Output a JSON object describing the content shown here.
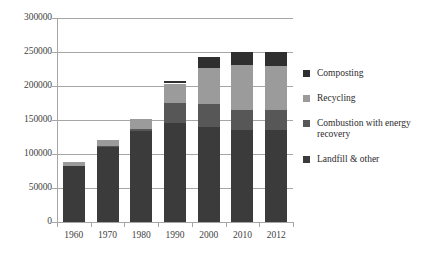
{
  "chart_data": {
    "type": "bar",
    "stacked": true,
    "title": "",
    "xlabel": "",
    "ylabel": "",
    "categories": [
      "1960",
      "1970",
      "1980",
      "1990",
      "2000",
      "2010",
      "2012"
    ],
    "ylim": [
      0,
      300000
    ],
    "ytick_labels": [
      "0",
      "50000",
      "100000",
      "150000",
      "200000",
      "250000",
      "300000"
    ],
    "ytick_values": [
      0,
      50000,
      100000,
      150000,
      200000,
      250000,
      300000
    ],
    "grid": true,
    "legend_position": "right",
    "series": [
      {
        "name": "Landfill & other",
        "color": "#3b3b3b",
        "values": [
          82500,
          112000,
          134000,
          145000,
          140000,
          136000,
          135000
        ]
      },
      {
        "name": "Combustion with energy recovery",
        "color": "#575757",
        "values": [
          0,
          450,
          2700,
          29700,
          33700,
          29300,
          29300
        ]
      },
      {
        "name": "Recycling",
        "color": "#9b9b9b",
        "values": [
          5600,
          8000,
          14500,
          29000,
          53000,
          65000,
          65000
        ]
      },
      {
        "name": "Composting",
        "color": "#2f2f2f",
        "values": [
          0,
          0,
          0,
          4200,
          16500,
          20000,
          20500
        ]
      }
    ],
    "totals": [
      88100,
      120450,
      151200,
      207900,
      243200,
      250300,
      249900
    ]
  },
  "legend": {
    "items": [
      {
        "label": "Composting",
        "color": "#2f2f2f"
      },
      {
        "label": "Recycling",
        "color": "#9b9b9b"
      },
      {
        "label": "Combustion with energy recovery",
        "color": "#575757"
      },
      {
        "label": "Landfill & other",
        "color": "#3b3b3b"
      }
    ]
  }
}
